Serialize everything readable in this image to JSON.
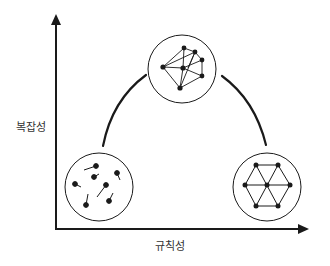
{
  "diagram": {
    "y_axis_label": "복잡성",
    "x_axis_label": "규칙성",
    "colors": {
      "stroke": "#1a1a1a",
      "background": "#ffffff",
      "text": "#333333"
    },
    "nodes": [
      {
        "id": "disorder",
        "description": "scattered random particles",
        "position": "bottom-left"
      },
      {
        "id": "complex",
        "description": "irregular directed network",
        "position": "top-center"
      },
      {
        "id": "order",
        "description": "regular hexagonal lattice",
        "position": "bottom-right"
      }
    ],
    "arc": "connects bottom-left to top-center to bottom-right"
  }
}
